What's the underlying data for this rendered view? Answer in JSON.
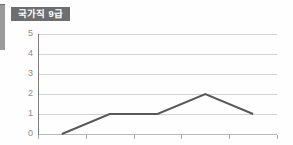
{
  "badge": {
    "label": "국가직 9급",
    "bg_color": "#6e6e6e",
    "text_color": "#ffffff"
  },
  "edge_fragment": {
    "name": "left-edge-bar",
    "color": "#9a9a9a"
  },
  "chart_data": {
    "type": "line",
    "title": "국가직 9급",
    "xlabel": "",
    "ylabel": "",
    "categories": [
      "2018",
      "2019",
      "2020",
      "2021",
      "2022"
    ],
    "values": [
      0,
      1,
      1,
      2,
      1
    ],
    "series": [
      {
        "name": "국가직 9급",
        "values": [
          0,
          1,
          1,
          2,
          1
        ],
        "color": "#585858"
      }
    ],
    "x": [
      "2018",
      "2019",
      "2020",
      "2021",
      "2022"
    ],
    "ylim": [
      0,
      5
    ],
    "y_ticks": [
      0,
      1,
      2,
      3,
      4,
      5
    ],
    "y_tick_labels": [
      "0",
      "1",
      "2",
      "3",
      "4",
      "5"
    ],
    "grid": true,
    "grid_axis": "y",
    "grid_color": "#d2d2d2",
    "legend": false,
    "legend_position": "none",
    "markers": false,
    "line_color": "#585858",
    "axis_color": "#7d7d7d",
    "tick_label_color": "#8a8a8a",
    "background": "#ffffff"
  }
}
